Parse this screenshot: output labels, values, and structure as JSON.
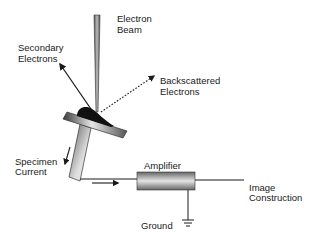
{
  "diagram": {
    "type": "SEM specimen current imaging schematic",
    "labels": {
      "electron_beam": [
        "Electron",
        "Beam"
      ],
      "secondary_electrons": [
        "Secondary",
        "Electrons"
      ],
      "backscattered_electrons": [
        "Backscattered",
        "Electrons"
      ],
      "specimen_current": [
        "Specimen",
        "Current"
      ],
      "amplifier": "Amplifier",
      "image_construction": [
        "Image",
        "Construction"
      ],
      "ground": "Ground"
    },
    "colors": {
      "line": "#1a1a1a",
      "metal_dark": "#4a4a4a",
      "metal_light": "#e8e8e8",
      "specimen": "#111111"
    }
  }
}
